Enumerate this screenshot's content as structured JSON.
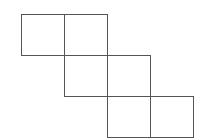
{
  "diagram": {
    "type": "cube-net",
    "stroke_color": "#555555",
    "background": "#ffffff",
    "cell_width": 43,
    "cell_height": 41,
    "origin": [
      21,
      14
    ],
    "squares": [
      {
        "row": 0,
        "col": 0
      },
      {
        "row": 0,
        "col": 1
      },
      {
        "row": 1,
        "col": 1
      },
      {
        "row": 1,
        "col": 2
      },
      {
        "row": 2,
        "col": 2
      },
      {
        "row": 2,
        "col": 3
      }
    ]
  }
}
